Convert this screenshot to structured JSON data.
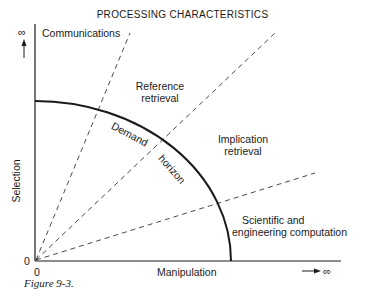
{
  "figure": {
    "title": "PROCESSING CHARACTERISTICS",
    "caption": "Figure 9-3.",
    "y_axis": {
      "label": "Selection",
      "min_label": "0",
      "max_label": "∞"
    },
    "x_axis": {
      "label": "Manipulation",
      "min_label": "0",
      "max_label": "∞"
    },
    "curve_label_1": "Demand",
    "curve_label_2": "horizon",
    "regions": [
      {
        "label_line1": "Communications",
        "label_line2": ""
      },
      {
        "label_line1": "Reference",
        "label_line2": "retrieval"
      },
      {
        "label_line1": "Implication",
        "label_line2": "retrieval"
      },
      {
        "label_line1": "Scientific and",
        "label_line2": "engineering computation"
      }
    ]
  },
  "colors": {
    "ink": "#1a1a1a",
    "background": "#ffffff"
  }
}
